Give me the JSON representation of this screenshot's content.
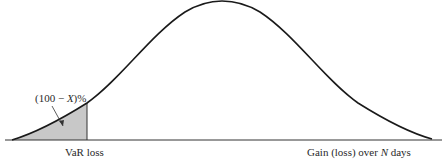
{
  "chart_data": {
    "type": "area",
    "title": "",
    "xlabel": "Gain (loss) over N days",
    "ylabel": "",
    "annotations": [
      {
        "text": "(100 − X)%",
        "target": "shaded left tail area"
      },
      {
        "text": "VaR loss",
        "target": "x position where shaded tail ends"
      }
    ],
    "shaded_region": {
      "from": "left tail",
      "to": "VaR loss",
      "color": "#c8c8c8"
    },
    "grid": false,
    "legend": null
  },
  "labels": {
    "tail_percent": "(100 − X)%",
    "var_loss": "VaR loss",
    "x_axis": "Gain (loss) over N days"
  },
  "colors": {
    "curve": "#1a1a1a",
    "shade": "#c8c8c8",
    "axis": "#333333"
  }
}
